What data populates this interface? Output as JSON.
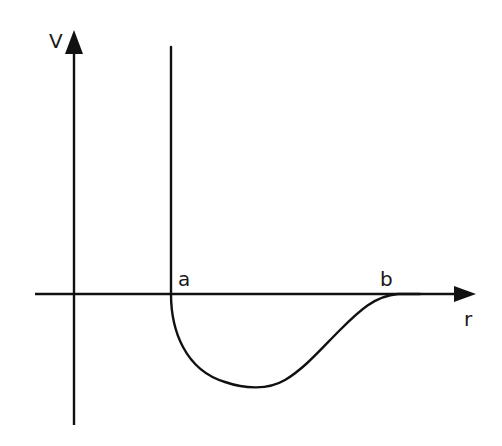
{
  "diagram": {
    "colors": {
      "background": "#ffffff",
      "stroke": "#111111",
      "text": "#1a1a1a"
    },
    "axes": {
      "vertical": {
        "label": "V",
        "x": 74,
        "y_top": 30,
        "y_bottom": 425,
        "arrow": "up"
      },
      "horizontal": {
        "label": "r",
        "y": 294,
        "x_left": 35,
        "x_right": 476,
        "arrow": "right"
      }
    },
    "markers": [
      {
        "label": "a",
        "x": 178,
        "y": 285,
        "meaning": "r position of hard wall / zero crossing"
      },
      {
        "label": "b",
        "x": 380,
        "y": 285,
        "meaning": "r position where potential returns to zero"
      }
    ],
    "curve": {
      "description": "Vertical wall at r=a extending from above down to V=0, then a potential well dipping to a minimum between a and b and rising smoothly back to V=0 at r=b",
      "wall_x": 171,
      "wall_top_y": 47,
      "minimum": {
        "x": 258,
        "y": 387
      },
      "rejoin_x": 398
    }
  }
}
